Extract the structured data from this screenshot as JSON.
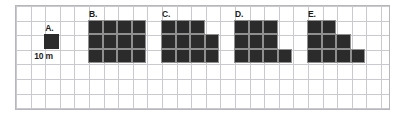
{
  "figure": {
    "type": "area-comparison-grid",
    "grid": {
      "cell_size_px": 14.6,
      "cols": 25,
      "rows": 7,
      "line_color": "#c9c9cf",
      "border_color": "#b6b6bd",
      "background_color": "#ffffff"
    },
    "shape_fill_color": "#2b2b2b",
    "shape_gridline_color": "#8f8f8f",
    "unit_caption": "10 m"
  },
  "shapes": [
    {
      "id": "A",
      "label": "A.",
      "caption": "10 m",
      "rows": [
        1
      ],
      "cell_count": 1,
      "width_units": 1,
      "height_units": 1,
      "origin_col": 2,
      "origin_row": 2
    },
    {
      "id": "B",
      "label": "B.",
      "caption": "",
      "rows": [
        4,
        4,
        4
      ],
      "cell_count": 12,
      "width_units": 4,
      "height_units": 3,
      "origin_col": 5,
      "origin_row": 1
    },
    {
      "id": "C",
      "label": "C.",
      "caption": "",
      "rows": [
        3,
        4,
        4
      ],
      "cell_count": 11,
      "width_units": 4,
      "height_units": 3,
      "origin_col": 10,
      "origin_row": 1
    },
    {
      "id": "D",
      "label": "D.",
      "caption": "",
      "rows": [
        3,
        3,
        4
      ],
      "cell_count": 10,
      "width_units": 4,
      "height_units": 3,
      "origin_col": 15,
      "origin_row": 1
    },
    {
      "id": "E",
      "label": "E.",
      "caption": "",
      "rows": [
        2,
        3,
        4
      ],
      "cell_count": 9,
      "width_units": 4,
      "height_units": 3,
      "origin_col": 20,
      "origin_row": 1
    }
  ]
}
